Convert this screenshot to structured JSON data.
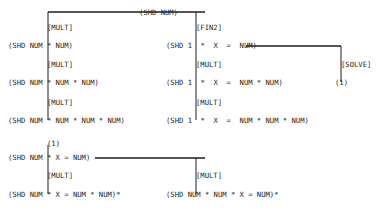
{
  "diagram": {
    "line_color": "#1d1d1d",
    "text_color": "#262626",
    "background": "#ffffff",
    "nodes": [
      {
        "id": "root",
        "label": "(SHD NUM)",
        "x": 139,
        "y": 8
      },
      {
        "id": "l1",
        "label": "(SHD NUM * NUM)",
        "x": 8,
        "y": 41
      },
      {
        "id": "l2",
        "label": "(SHD NUM * NUM * NUM)",
        "x": 8,
        "y": 78
      },
      {
        "id": "l3",
        "label": "(SHD NUM * NUM * NUM * NUM)",
        "x": 8,
        "y": 116
      },
      {
        "id": "r1",
        "label": "(SHD 1  *  X  =  NUM)",
        "x": 166,
        "y": 41
      },
      {
        "id": "r2",
        "label": "(SHD 1  *  X  =  NUM * NUM)",
        "x": 166,
        "y": 78
      },
      {
        "id": "r3",
        "label": "(SHD 1  *  X  =  NUM * NUM * NUM)",
        "x": 166,
        "y": 116
      },
      {
        "id": "solve_out",
        "label": "(1)",
        "x": 335,
        "y": 78
      },
      {
        "id": "b_in",
        "label": "(1)",
        "x": 47,
        "y": 139
      },
      {
        "id": "b1",
        "label": "(SHD NUM * X = NUM)",
        "x": 8,
        "y": 153
      },
      {
        "id": "b2",
        "label": "(SHD NUM * X = NUM * NUM)*",
        "x": 8,
        "y": 190
      },
      {
        "id": "b3",
        "label": "(SHD NUM * NUM * X = NUM)*",
        "x": 166,
        "y": 190
      }
    ],
    "operators": [
      {
        "id": "op_l1",
        "label": "[MULT]",
        "x": 47,
        "y": 23
      },
      {
        "id": "op_l2",
        "label": "[MULT]",
        "x": 47,
        "y": 60
      },
      {
        "id": "op_l3",
        "label": "[MULT]",
        "x": 47,
        "y": 98
      },
      {
        "id": "op_r1",
        "label": "[FIN2]",
        "x": 196,
        "y": 23
      },
      {
        "id": "op_r2",
        "label": "[MULT]",
        "x": 196,
        "y": 60
      },
      {
        "id": "op_r3",
        "label": "[MULT]",
        "x": 196,
        "y": 98
      },
      {
        "id": "op_solve",
        "label": "[SOLVE]",
        "x": 341,
        "y": 60
      },
      {
        "id": "op_b1",
        "label": "[MULT]",
        "x": 47,
        "y": 171
      },
      {
        "id": "op_b2",
        "label": "[MULT]",
        "x": 196,
        "y": 171
      }
    ]
  }
}
